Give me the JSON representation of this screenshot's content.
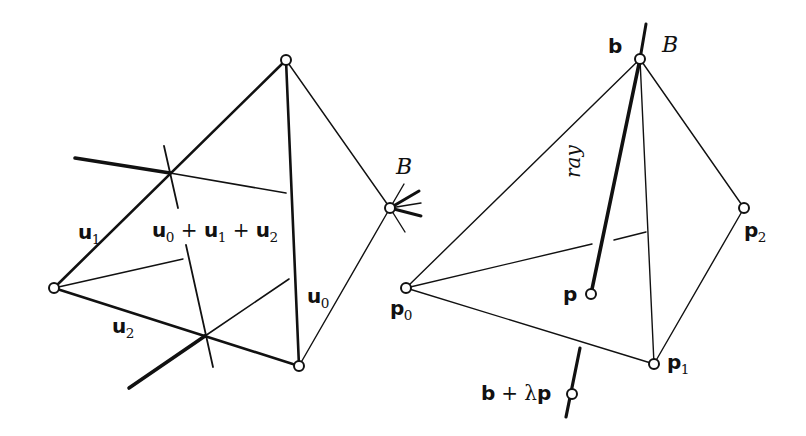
{
  "figure": {
    "ink_color": "#111111",
    "background": "#ffffff"
  },
  "left_panel": {
    "labels": {
      "u1": {
        "base": "u",
        "sub": "1"
      },
      "u2": {
        "base": "u",
        "sub": "2"
      },
      "u0": {
        "base": "u",
        "sub": "0"
      },
      "sum": {
        "t0": "u",
        "s0": "0",
        "p1": " + ",
        "t1": "u",
        "s1": "1",
        "p2": " + ",
        "t2": "u",
        "s2": "2"
      },
      "B": "B"
    }
  },
  "right_panel": {
    "labels": {
      "b": "b",
      "B": "B",
      "ray": "ray",
      "p": "p",
      "p0": {
        "base": "p",
        "sub": "0"
      },
      "p1": {
        "base": "p",
        "sub": "1"
      },
      "p2": {
        "base": "p",
        "sub": "2"
      },
      "bp": {
        "b": "b",
        "plus": " + ",
        "lambda": "λ",
        "p": "p"
      }
    }
  }
}
